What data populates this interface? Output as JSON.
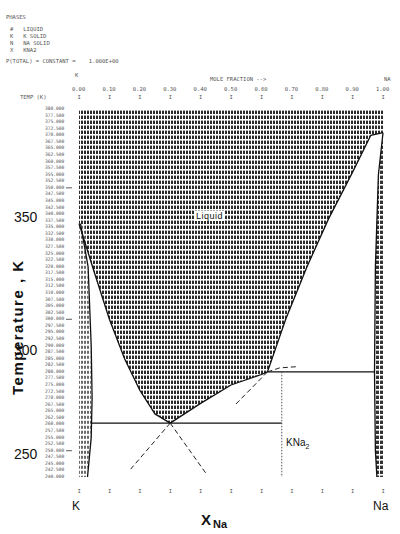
{
  "header": {
    "phases_title": "PHASES",
    "phases": [
      {
        "symbol": "#",
        "name": "LIQUID"
      },
      {
        "symbol": "K",
        "name": "K SOLID"
      },
      {
        "symbol": "N",
        "name": "NA SOLID"
      },
      {
        "symbol": "X",
        "name": "KNA2"
      }
    ],
    "constraint": "P(TOTAL) = CONSTANT =    1.000E+00",
    "left_component": "K",
    "right_component": "NA",
    "axis_caption": "MOLE FRACTION -->",
    "temp_header": "TEMP (K)"
  },
  "chart_data": {
    "type": "area",
    "xlabel": "X_Na",
    "ylabel": "Temperature, K",
    "xlim": [
      0.0,
      1.0
    ],
    "ylim": [
      240,
      380
    ],
    "x_ticks": [
      "0.00",
      "0.10",
      "0.20",
      "0.30",
      "0.40",
      "0.50",
      "0.60",
      "0.70",
      "0.80",
      "0.90",
      "1.00"
    ],
    "y_rows": [
      "380.000",
      "377.500",
      "375.000",
      "372.500",
      "370.000",
      "367.500",
      "365.000",
      "362.500",
      "360.000",
      "357.500",
      "355.000",
      "352.500",
      "350.000",
      "347.500",
      "345.000",
      "342.500",
      "340.000",
      "337.500",
      "335.000",
      "332.500",
      "330.000",
      "327.500",
      "325.000",
      "322.500",
      "320.000",
      "317.500",
      "315.000",
      "312.500",
      "310.000",
      "307.500",
      "305.000",
      "302.500",
      "300.000",
      "297.500",
      "295.000",
      "292.500",
      "290.000",
      "287.500",
      "285.000",
      "282.500",
      "280.000",
      "277.500",
      "275.000",
      "272.500",
      "270.000",
      "267.500",
      "265.000",
      "262.500",
      "260.000",
      "257.500",
      "255.000",
      "252.500",
      "250.000",
      "247.500",
      "245.000",
      "242.500",
      "240.000"
    ],
    "y_major_labels": [
      {
        "value": 350,
        "label": "350"
      },
      {
        "value": 300,
        "label": "300"
      },
      {
        "value": 250,
        "label": "250"
      }
    ],
    "liquidus_K_side": [
      [
        0.0,
        336.4
      ],
      [
        0.05,
        318
      ],
      [
        0.1,
        300
      ],
      [
        0.15,
        285
      ],
      [
        0.2,
        273
      ],
      [
        0.25,
        264
      ],
      [
        0.3,
        260.5
      ]
    ],
    "liquidus_KNa2_side": [
      [
        0.3,
        260.5
      ],
      [
        0.4,
        268
      ],
      [
        0.5,
        275
      ],
      [
        0.6,
        279
      ],
      [
        0.62,
        280
      ]
    ],
    "liquidus_Na_side": [
      [
        0.62,
        280
      ],
      [
        0.68,
        300
      ],
      [
        0.75,
        320
      ],
      [
        0.82,
        338
      ],
      [
        0.9,
        356
      ],
      [
        0.96,
        370
      ],
      [
        1.0,
        371
      ]
    ],
    "eutectic": {
      "x": 0.3,
      "T": 260.5
    },
    "peritectic": {
      "x": 0.62,
      "T": 280
    },
    "KNa2_compound": {
      "x": 0.667,
      "T_max": 280
    },
    "labels": [
      {
        "text": "Liquid",
        "x": 0.45,
        "T": 340
      },
      {
        "text": "KNa2",
        "x": 0.72,
        "T": 255
      }
    ],
    "axis_end_labels": [
      "K",
      "Na"
    ]
  },
  "bottom": {
    "left_label": "K",
    "right_label": "Na",
    "xlabel_main": "X",
    "xlabel_sub": "Na"
  },
  "yaxis": {
    "title": "Temperature , K",
    "major": [
      "350",
      "300",
      "250"
    ]
  }
}
